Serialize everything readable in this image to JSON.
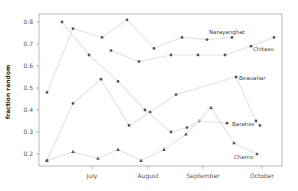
{
  "chart_data": {
    "type": "line",
    "title": "",
    "xlabel": "",
    "ylabel": "fraction random",
    "ylim": [
      0.15,
      0.84
    ],
    "yticks": [
      0.2,
      0.3,
      0.4,
      0.5,
      0.6,
      0.7,
      0.8
    ],
    "ytick_labels": [
      "0.2",
      "0.3",
      "0.4",
      "0.5",
      "0.6",
      "0.7",
      "0.8"
    ],
    "xticks": [
      {
        "label": "July",
        "x": 92
      },
      {
        "label": "August",
        "x": 148
      },
      {
        "label": "September",
        "x": 203
      },
      {
        "label": "October",
        "x": 262
      }
    ],
    "grid": false,
    "legend": "none (direct labels)",
    "series": [
      {
        "name": "Narayanghat",
        "marker": "dot",
        "points": [
          [
            47,
            0.48
          ],
          [
            73,
            0.77
          ],
          [
            102,
            0.73
          ],
          [
            127,
            0.81
          ],
          [
            154,
            0.68
          ],
          [
            182,
            0.73
          ],
          [
            207,
            0.72
          ],
          [
            232,
            0.73
          ]
        ]
      },
      {
        "name": "Chitasu",
        "marker": "dot",
        "points": [
          [
            111,
            0.67
          ],
          [
            139,
            0.62
          ],
          [
            171,
            0.65
          ],
          [
            198,
            0.65
          ],
          [
            225,
            0.65
          ],
          [
            251,
            0.69
          ],
          [
            274,
            0.73
          ]
        ]
      },
      {
        "name": "Beauahar",
        "marker": "dot",
        "points": [
          [
            47,
            0.17
          ],
          [
            73,
            0.43
          ],
          [
            101,
            0.54
          ],
          [
            129,
            0.33
          ],
          [
            150,
            0.39
          ],
          [
            176,
            0.47
          ],
          [
            236,
            0.55
          ],
          [
            256,
            0.35
          ],
          [
            260,
            0.33
          ]
        ]
      },
      {
        "name": "Barahse",
        "marker": "dot",
        "points": [
          [
            62,
            0.8
          ],
          [
            89,
            0.65
          ],
          [
            118,
            0.53
          ],
          [
            145,
            0.4
          ],
          [
            171,
            0.3
          ],
          [
            187,
            0.32
          ],
          [
            199,
            0.35
          ],
          [
            227,
            0.34
          ]
        ]
      },
      {
        "name": "Charne",
        "marker": "triangle",
        "points": [
          [
            47,
            0.17
          ],
          [
            73,
            0.21
          ],
          [
            98,
            0.18
          ],
          [
            118,
            0.22
          ],
          [
            141,
            0.17
          ],
          [
            164,
            0.22
          ],
          [
            186,
            0.29
          ],
          [
            211,
            0.41
          ],
          [
            234,
            0.25
          ],
          [
            257,
            0.2
          ]
        ]
      }
    ],
    "annotations": [
      {
        "text": "Narayanghat",
        "x": 209,
        "y": 34
      },
      {
        "text": "Chitasu",
        "x": 253,
        "y": 51
      },
      {
        "text": "Beauahar",
        "x": 239,
        "y": 80
      },
      {
        "text": "Barahse",
        "x": 232,
        "y": 126
      },
      {
        "text": "Charne",
        "x": 234,
        "y": 159
      }
    ]
  },
  "colors": {
    "line": "#e4e4e4",
    "marker": "#555555",
    "axis": "#888888",
    "frame": "#aaaaaa"
  }
}
